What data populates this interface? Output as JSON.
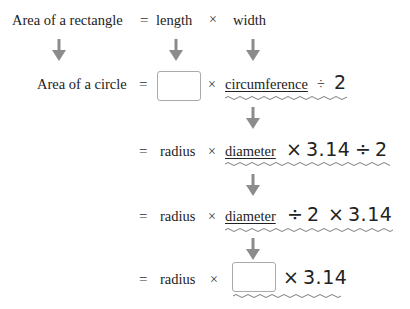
{
  "row1": {
    "label": "Area of a rectangle",
    "equals": "=",
    "length": "length",
    "times": "×",
    "width": "width"
  },
  "row2": {
    "label": "Area of a circle",
    "equals": "=",
    "blank": "",
    "times": "×",
    "circumference": "circumference",
    "divide": "÷",
    "two": "2"
  },
  "row3": {
    "equals": "=",
    "radius": "radius",
    "times1": "×",
    "diameter": "diameter",
    "times2": "×",
    "pi": "3.14",
    "divide": "÷",
    "two": "2"
  },
  "row4": {
    "equals": "=",
    "radius": "radius",
    "times1": "×",
    "diameter": "diameter",
    "divide": "÷",
    "two": "2",
    "times2": "×",
    "pi": "3.14"
  },
  "row5": {
    "equals": "=",
    "radius": "radius",
    "times1": "×",
    "blank": "",
    "times2": "×",
    "pi": "3.14"
  },
  "colors": {
    "arrow": "#8c8c8c",
    "wave": "#7a7a7a",
    "box_border": "#aaaaaa"
  }
}
